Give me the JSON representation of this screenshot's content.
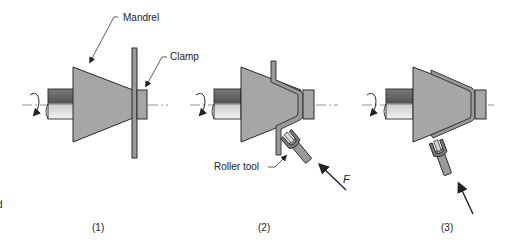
{
  "labels": {
    "mandrel": "Mandrel",
    "clamp": "Clamp",
    "roller_tool": "Roller tool",
    "force": "F",
    "edge_fragment": "d"
  },
  "steps": [
    {
      "label": "(1)"
    },
    {
      "label": "(2)"
    },
    {
      "label": "(3)"
    }
  ],
  "colors": {
    "mandrel_fill": "#a6a6a6",
    "shaft_dark": "#5e5e5e",
    "shaft_light": "#e8e8e8",
    "outline": "#2a2a2a",
    "centerline": "#7a7a7a",
    "workpiece_fill": "#9a9a9a"
  }
}
